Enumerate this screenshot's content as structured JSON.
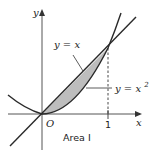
{
  "figure": {
    "labels": {
      "y_axis": "y",
      "x_axis": "x",
      "origin": "O",
      "tick_x1": "1",
      "line_label": "y = x",
      "parabola_label_base": "y = x",
      "parabola_label_exp": "2",
      "region_label": "Area I"
    },
    "colors": {
      "shaded_region": "#bdbdbd",
      "curves": "#2a2a2a",
      "axes": "#555555"
    },
    "curves": [
      {
        "name": "line",
        "equation": "y = x"
      },
      {
        "name": "parabola",
        "equation": "y = x^2"
      }
    ],
    "shaded_region": "area between y = x and y = x^2 for 0 ≤ x ≤ 1",
    "intersection_points": [
      [
        0,
        0
      ],
      [
        1,
        1
      ]
    ]
  }
}
